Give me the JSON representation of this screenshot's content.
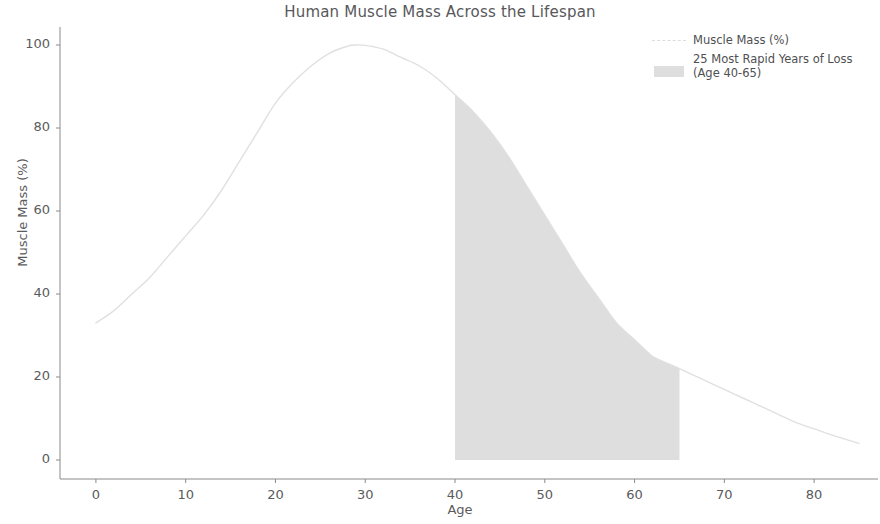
{
  "chart_data": {
    "type": "line",
    "title": "Human Muscle Mass Across the Lifespan",
    "xlabel": "Age",
    "ylabel": "Muscle Mass (%)",
    "xlim": [
      -4,
      86
    ],
    "ylim": [
      -3,
      105
    ],
    "xticks": [
      "0",
      "10",
      "20",
      "30",
      "40",
      "50",
      "60",
      "70",
      "80"
    ],
    "xtick_values": [
      0,
      10,
      20,
      30,
      40,
      50,
      60,
      70,
      80
    ],
    "yticks": [
      "0",
      "20",
      "40",
      "60",
      "80",
      "100"
    ],
    "ytick_values": [
      0,
      20,
      40,
      60,
      80,
      100
    ],
    "grid": false,
    "legend_position": "upper right",
    "line_color": "#e0e0e0",
    "fill_color": "#dedede",
    "text_color": "#57585a",
    "series": [
      {
        "name": "Muscle Mass (%)",
        "x": [
          0,
          2,
          4,
          6,
          8,
          10,
          12,
          14,
          16,
          18,
          20,
          22,
          24,
          26,
          28,
          29,
          30,
          32,
          34,
          36,
          38,
          40,
          42,
          44,
          46,
          48,
          50,
          52,
          54,
          56,
          58,
          60,
          62,
          64,
          65,
          66,
          68,
          70,
          72,
          74,
          76,
          78,
          80,
          82,
          85
        ],
        "values": [
          33,
          36,
          40,
          44,
          49,
          54,
          59,
          65,
          72,
          79,
          86,
          91,
          95,
          98,
          99.7,
          100,
          99.9,
          99,
          97,
          95,
          92,
          88,
          84,
          79,
          73,
          66,
          59,
          52,
          45,
          39,
          33,
          29,
          25,
          23,
          22,
          21,
          19,
          17,
          15,
          13,
          11,
          9,
          7.5,
          6,
          4
        ]
      }
    ],
    "shaded_region": {
      "label": "25 Most Rapid Years of Loss\n(Age 40-65)",
      "x_start": 40,
      "x_end": 65,
      "y_base": 0
    },
    "legend_entries": [
      {
        "label": "Muscle Mass (%)",
        "marker": "line"
      },
      {
        "label": "25 Most Rapid Years of Loss\n(Age 40-65)",
        "marker": "patch"
      }
    ]
  }
}
